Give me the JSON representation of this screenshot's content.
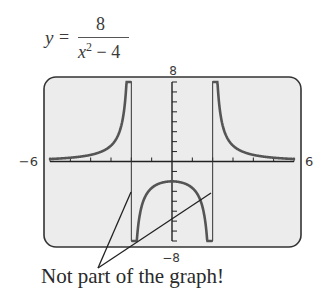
{
  "equation": {
    "lhs": "y",
    "equals": "=",
    "numerator": "8",
    "denominator_var": "x",
    "denominator_exp": "2",
    "denominator_rest": " − 4"
  },
  "caption": "Not part of the graph!",
  "chart_data": {
    "type": "line",
    "function": "8/(x^2-4)",
    "xlim": [
      -6,
      6
    ],
    "ylim": [
      -8,
      8
    ],
    "xscale_ticks": 1,
    "yscale_ticks": 1,
    "tick_labels": {
      "xmin": "−6",
      "xmax": "6",
      "ymin": "−8",
      "ymax": "8"
    },
    "vertical_asymptotes": [
      -2,
      2
    ],
    "spurious_lines_note": "Not part of the graph!",
    "series": [
      {
        "name": "left branch",
        "x": [
          -6,
          -5,
          -4,
          -3,
          -2.5,
          -2.2,
          -2.1
        ],
        "values": [
          0.25,
          0.38,
          0.67,
          1.6,
          3.56,
          9.52,
          19.5
        ]
      },
      {
        "name": "middle branch",
        "x": [
          -1.9,
          -1.8,
          -1.5,
          -1,
          0,
          1,
          1.5,
          1.8,
          1.9
        ],
        "values": [
          -20.5,
          -10.5,
          -4.57,
          -2.67,
          -2,
          -2.67,
          -4.57,
          -10.5,
          -20.5
        ]
      },
      {
        "name": "right branch",
        "x": [
          2.1,
          2.2,
          2.5,
          3,
          4,
          5,
          6
        ],
        "values": [
          19.5,
          9.52,
          3.56,
          1.6,
          0.67,
          0.38,
          0.25
        ]
      }
    ],
    "grid": false,
    "legend": null
  },
  "colors": {
    "screen_bg": "#ececec",
    "curve": "#555555",
    "frame": "#333333"
  }
}
